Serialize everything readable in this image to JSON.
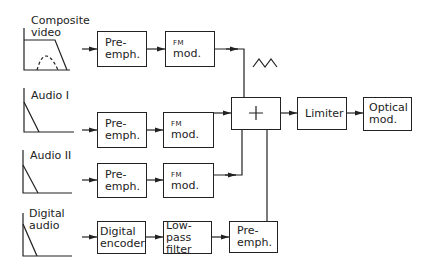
{
  "diagram": {
    "type": "signal-flow block diagram",
    "inputs": [
      {
        "label_line1": "Composite",
        "label_line2": "video",
        "spectrum": "flat-top with dashed hump"
      },
      {
        "label_line1": "Audio I",
        "label_line2": "",
        "spectrum": "falling slope"
      },
      {
        "label_line1": "Audio II",
        "label_line2": "",
        "spectrum": "falling slope"
      },
      {
        "label_line1": "Digital",
        "label_line2": "audio",
        "spectrum": "falling slope"
      }
    ],
    "rows": [
      {
        "blocks": [
          {
            "l1": "Pre-",
            "l2": "emph."
          },
          {
            "l1": "FM",
            "l2": "mod."
          }
        ]
      },
      {
        "blocks": [
          {
            "l1": "Pre-",
            "l2": "emph."
          },
          {
            "l1": "FM",
            "l2": "mod."
          }
        ]
      },
      {
        "blocks": [
          {
            "l1": "Pre-",
            "l2": "emph."
          },
          {
            "l1": "FM",
            "l2": "mod."
          }
        ]
      },
      {
        "blocks": [
          {
            "l1": "Digital",
            "l2": "encoder"
          },
          {
            "l1": "Low-pass",
            "l2": "filter"
          },
          {
            "l1": "Pre-",
            "l2": "emph."
          }
        ]
      }
    ],
    "summer": {
      "symbol": "+"
    },
    "limiter": {
      "l1": "Limiter"
    },
    "optical": {
      "l1": "Optical",
      "l2": "mod."
    },
    "triangle_wave_symbol": "triangle-wave"
  }
}
